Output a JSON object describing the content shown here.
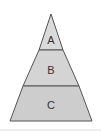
{
  "diagram": {
    "type": "pyramid",
    "levels": [
      {
        "label": "A",
        "color": "#d9d9d9"
      },
      {
        "label": "B",
        "color": "#d3d3d3"
      },
      {
        "label": "C",
        "color": "#cccccc"
      }
    ],
    "outline_color": "#555555"
  }
}
